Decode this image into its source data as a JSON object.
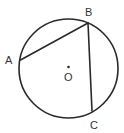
{
  "diagram": {
    "type": "circle-geometry",
    "circle": {
      "center": "O",
      "cx": 68.5,
      "cy": 68.5,
      "r": 49.5
    },
    "points": [
      {
        "name": "A",
        "x": 20.5,
        "y": 60,
        "label": "A",
        "label_x": 5,
        "label_y": 64
      },
      {
        "name": "B",
        "x": 88,
        "y": 23,
        "label": "B",
        "label_x": 85,
        "label_y": 16
      },
      {
        "name": "C",
        "x": 92,
        "y": 111,
        "label": "C",
        "label_x": 90,
        "label_y": 129
      }
    ],
    "center_point": {
      "name": "O",
      "x": 68.5,
      "y": 67,
      "label": "O",
      "label_x": 64,
      "label_y": 81
    },
    "segments": [
      {
        "from": "A",
        "to": "B"
      },
      {
        "from": "B",
        "to": "C"
      }
    ],
    "colors": {
      "stroke": "#2a2a2a",
      "label": "#333333",
      "background": "#ffffff"
    }
  }
}
